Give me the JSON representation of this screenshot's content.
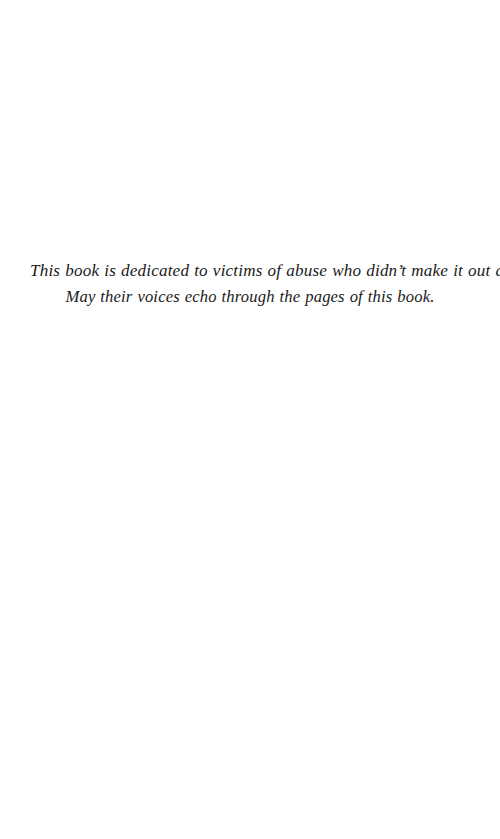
{
  "page": {
    "kind": "book-dedication-page",
    "background_color": "#ffffff",
    "text_color": "#1a1a1a"
  },
  "dedication": {
    "lines": [
      "This book is dedicated to victims of abuse who didn’t make it out alive.",
      "May their voices echo through the pages of this book."
    ]
  }
}
